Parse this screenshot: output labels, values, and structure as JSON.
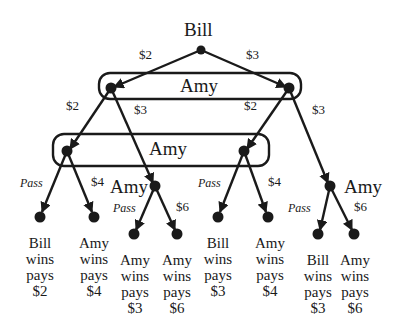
{
  "tree": {
    "root": {
      "player": "Bill",
      "moves": [
        "$2",
        "$3"
      ]
    },
    "info_set_1": {
      "player": "Amy",
      "left_moves": [
        "$2",
        "$3"
      ],
      "right_moves": [
        "$2",
        "$3"
      ]
    },
    "info_set_2": {
      "player": "Amy",
      "left_moves": [
        "Pass",
        "$4"
      ],
      "right_moves": [
        "Pass",
        "$4"
      ]
    },
    "node_left_amy": {
      "player": "Amy",
      "moves": [
        "Pass",
        "$6"
      ]
    },
    "node_right_amy": {
      "player": "Amy",
      "moves": [
        "Pass",
        "$6"
      ]
    },
    "outcomes": [
      {
        "lines": [
          "Bill",
          "wins",
          "pays",
          "$2"
        ]
      },
      {
        "lines": [
          "Amy",
          "wins",
          "pays",
          "$4"
        ]
      },
      {
        "lines": [
          "Amy",
          "wins",
          "pays",
          "$3"
        ]
      },
      {
        "lines": [
          "Amy",
          "wins",
          "pays",
          "$6"
        ]
      },
      {
        "lines": [
          "Bill",
          "wins",
          "pays",
          "$3"
        ]
      },
      {
        "lines": [
          "Amy",
          "wins",
          "pays",
          "$4"
        ]
      },
      {
        "lines": [
          "Bill",
          "wins",
          "pays",
          "$3"
        ]
      },
      {
        "lines": [
          "Amy",
          "wins",
          "pays",
          "$6"
        ]
      }
    ]
  },
  "colors": {
    "ink": "#1a1a1a",
    "background": "#ffffff"
  }
}
